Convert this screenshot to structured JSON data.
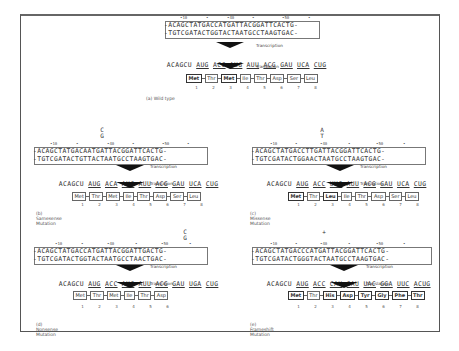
{
  "figure": {
    "step_labels": {
      "transcription": "Transcription",
      "translation": "Translation"
    },
    "panels": [
      {
        "id": "a",
        "caption": "(a) Wild type",
        "mutation_mark": "",
        "positions": [
          "•10",
          "•",
          "•40",
          "•",
          "•50",
          "•"
        ],
        "dna_top": "-ACAGCTATGACCATGATTACGGATTCACTG-",
        "dna_bottom": "-TGTCGATACTGGTACTAATGCCTAAGTGAC-",
        "mrna_prefix": "ACAGCU",
        "codons": [
          "AUG",
          "ACC",
          "AUG",
          "AUU",
          "ACG",
          "GAU",
          "UCA",
          "CUG"
        ],
        "protein": [
          "Met",
          "Thr",
          "Met",
          "Ile",
          "Thr",
          "Asp",
          "Ser",
          "Leu"
        ],
        "numbers": [
          "1",
          "2",
          "3",
          "4",
          "5",
          "6",
          "7",
          "8"
        ]
      },
      {
        "id": "b",
        "caption": "(b) Samesense Mutation",
        "mutation_mark": "C\nG",
        "positions": [
          "•10",
          "•",
          "•40",
          "•",
          "•50",
          "•"
        ],
        "dna_top": "-ACAGCTATGACAATGATTACGGATTCACTG-",
        "dna_bottom": "-TGTCGATACTGTTACTAATGCCTAAGTGAC-",
        "mrna_prefix": "ACAGCU",
        "codons": [
          "AUG",
          "ACA",
          "AUG",
          "AUU",
          "ACG",
          "GAU",
          "UCA",
          "CUG"
        ],
        "protein": [
          "Met",
          "Thr",
          "Met",
          "Ile",
          "Thr",
          "Asp",
          "Ser",
          "Leu"
        ],
        "numbers": [
          "1",
          "2",
          "3",
          "4",
          "5",
          "6",
          "7",
          "8"
        ]
      },
      {
        "id": "c",
        "caption": "(c) Missense Mutation",
        "mutation_mark": "A\nT",
        "positions": [
          "•10",
          "•",
          "•40",
          "•",
          "•50",
          "•"
        ],
        "dna_top": "-ACAGCTATGACCTTGATTACGGATTCACTG-",
        "dna_bottom": "-TGTCGATACTGGAACTAATGCCTAAGTGAC-",
        "mrna_prefix": "ACAGCU",
        "codons": [
          "AUG",
          "ACC",
          "UUG",
          "AUU",
          "ACG",
          "GAU",
          "UCA",
          "CUG"
        ],
        "protein": [
          "Met",
          "Thr",
          "Leu",
          "Ile",
          "Thr",
          "Asp",
          "Ser",
          "Leu"
        ],
        "numbers": [
          "1",
          "2",
          "3",
          "4",
          "5",
          "6",
          "7",
          "8"
        ]
      },
      {
        "id": "d",
        "caption": "(d) Nonsense Mutation",
        "mutation_mark": "C\nG",
        "positions": [
          "•10",
          "•",
          "•40",
          "•",
          "•50",
          "•"
        ],
        "dna_top": "-ACAGCTATGACCATGATTACGGATTGACTG-",
        "dna_bottom": "-TGTCGATACTGGTACTAATGCCTAACTGAC-",
        "mrna_prefix": "ACAGCU",
        "codons": [
          "AUG",
          "ACC",
          "AUG",
          "AUU",
          "ACG",
          "GAU",
          "UGA",
          "CUG"
        ],
        "protein": [
          "Met",
          "Thr",
          "Met",
          "Ile",
          "Thr",
          "Asp"
        ],
        "numbers": [
          "1",
          "2",
          "3",
          "4",
          "5",
          "6"
        ]
      },
      {
        "id": "e",
        "caption": "(e) Frameshift Mutation",
        "mutation_mark": "+",
        "positions": [
          "•10",
          "•",
          "•40",
          "•",
          "•50",
          "•"
        ],
        "dna_top": "-ACAGCTATGACCCATGATTACGGATTCACTG-",
        "dna_bottom": "-TGTCGATACTGGGTACTAATGCCTAAGTGAC-",
        "mrna_prefix": "ACAGCU",
        "codons": [
          "AUG",
          "ACC",
          "CAU",
          "GAU",
          "UAC",
          "GGA",
          "UUC",
          "ACUG"
        ],
        "protein": [
          "Met",
          "Thr",
          "His",
          "Asp",
          "Tyr",
          "Gly",
          "Phe",
          "Thr"
        ],
        "numbers": [
          "1",
          "2",
          "3",
          "4",
          "5",
          "6",
          "7",
          "8"
        ]
      }
    ]
  }
}
